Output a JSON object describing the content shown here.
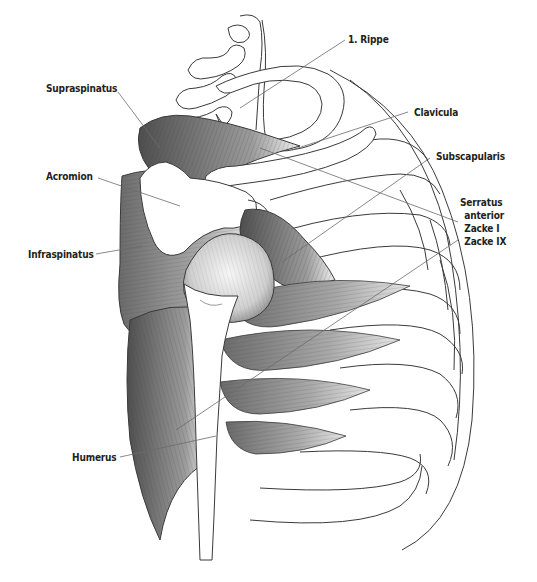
{
  "figure": {
    "labels": {
      "rippe": "1. Rippe",
      "supraspinatus": "Supraspinatus",
      "clavicula": "Clavicula",
      "acromion": "Acromion",
      "subscapularis": "Subscapularis",
      "serratus_line1": "Serratus",
      "serratus_line2": "anterior",
      "zacke1": "Zacke I",
      "zacke9": "Zacke IX",
      "infraspinatus": "Infraspinatus",
      "humerus": "Humerus"
    }
  },
  "colors": {
    "background": "#ffffff",
    "text": "#231f20",
    "outline": "#3a3a3a",
    "leader": "#6b6b6b",
    "muscle_dark": "#5a5a5a",
    "muscle_mid": "#9a9a9a",
    "muscle_light": "#d4d4d4"
  }
}
